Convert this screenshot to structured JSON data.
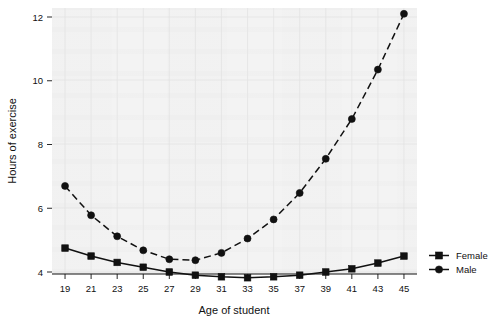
{
  "chart_data": {
    "type": "line",
    "title": "",
    "xlabel": "Age of student",
    "ylabel": "Hours of exercise",
    "categories": [
      19,
      21,
      23,
      25,
      27,
      29,
      31,
      33,
      35,
      37,
      39,
      41,
      43,
      45
    ],
    "x": [
      19,
      21,
      23,
      25,
      27,
      29,
      31,
      33,
      35,
      37,
      39,
      41,
      43,
      45
    ],
    "xlim": [
      18,
      46
    ],
    "ylim": [
      3.4,
      12.4
    ],
    "xticks": [
      "19",
      "21",
      "23",
      "25",
      "27",
      "29",
      "31",
      "33",
      "35",
      "37",
      "39",
      "41",
      "43",
      "45"
    ],
    "yticks": [
      "4",
      "6",
      "8",
      "10",
      "12"
    ],
    "ytick_values": [
      4,
      6,
      8,
      10,
      12
    ],
    "grid": true,
    "legend_position": "right",
    "series": [
      {
        "name": "Female",
        "marker": "square",
        "linestyle": "solid",
        "color": "#111111",
        "values": [
          4.75,
          4.5,
          4.3,
          4.15,
          4.0,
          3.9,
          3.85,
          3.82,
          3.85,
          3.9,
          4.0,
          4.1,
          4.28,
          4.5
        ]
      },
      {
        "name": "Male",
        "marker": "circle",
        "linestyle": "dashed",
        "color": "#111111",
        "values": [
          6.7,
          5.78,
          5.12,
          4.68,
          4.4,
          4.37,
          4.6,
          5.05,
          5.65,
          6.48,
          7.55,
          8.8,
          10.35,
          12.1
        ]
      }
    ]
  },
  "legend": {
    "items": [
      {
        "label": "Female",
        "marker": "square-marker-icon"
      },
      {
        "label": "Male",
        "marker": "circle-marker-icon"
      }
    ]
  },
  "axes": {
    "x_title": "Age of student",
    "y_title": "Hours of exercise"
  }
}
